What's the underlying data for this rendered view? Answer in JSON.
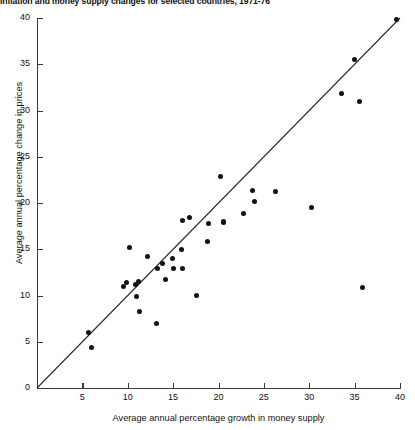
{
  "chart_data": {
    "type": "scatter",
    "title": "Inflation and money supply changes for selected countries, 1971-76",
    "xlabel": "Average annual percentage growth in money supply",
    "ylabel": "Average annual percentage change in prices",
    "xlim": [
      0,
      40
    ],
    "ylim": [
      0,
      40
    ],
    "xticks": [
      0,
      5,
      10,
      15,
      20,
      25,
      30,
      35,
      40
    ],
    "yticks": [
      0,
      5,
      10,
      15,
      20,
      25,
      30,
      35,
      40
    ],
    "xtick_labels": [
      "",
      "5",
      "10",
      "15",
      "20",
      "25",
      "30",
      "35",
      "40"
    ],
    "ytick_labels": [
      "0",
      "5",
      "10",
      "15",
      "20",
      "25",
      "30",
      "35",
      "40"
    ],
    "grid": false,
    "legend": null,
    "origin_label": "0",
    "reference_line": {
      "label": "45-degree line",
      "x": [
        0,
        40
      ],
      "y": [
        0,
        40
      ]
    },
    "marker": {
      "shape": "circle",
      "color": "#111111",
      "size": 5
    },
    "points": [
      {
        "x": 6.0,
        "y": 4.4
      },
      {
        "x": 5.7,
        "y": 6.0
      },
      {
        "x": 9.5,
        "y": 11.0
      },
      {
        "x": 9.9,
        "y": 11.4
      },
      {
        "x": 10.2,
        "y": 15.2
      },
      {
        "x": 10.8,
        "y": 11.2
      },
      {
        "x": 11.0,
        "y": 9.9
      },
      {
        "x": 11.2,
        "y": 11.5
      },
      {
        "x": 11.3,
        "y": 8.3
      },
      {
        "x": 12.2,
        "y": 14.2
      },
      {
        "x": 13.2,
        "y": 7.0
      },
      {
        "x": 13.3,
        "y": 12.9
      },
      {
        "x": 13.8,
        "y": 13.5
      },
      {
        "x": 14.2,
        "y": 11.7
      },
      {
        "x": 14.9,
        "y": 14.0
      },
      {
        "x": 15.0,
        "y": 12.9
      },
      {
        "x": 15.9,
        "y": 15.0
      },
      {
        "x": 16.0,
        "y": 12.9
      },
      {
        "x": 16.0,
        "y": 18.1
      },
      {
        "x": 16.8,
        "y": 18.4
      },
      {
        "x": 17.6,
        "y": 10.0
      },
      {
        "x": 18.8,
        "y": 15.8
      },
      {
        "x": 18.9,
        "y": 17.8
      },
      {
        "x": 20.2,
        "y": 22.9
      },
      {
        "x": 20.5,
        "y": 18.0
      },
      {
        "x": 20.6,
        "y": 17.9
      },
      {
        "x": 22.7,
        "y": 18.9
      },
      {
        "x": 23.8,
        "y": 21.4
      },
      {
        "x": 24.0,
        "y": 20.2
      },
      {
        "x": 26.3,
        "y": 21.2
      },
      {
        "x": 30.3,
        "y": 19.5
      },
      {
        "x": 33.5,
        "y": 31.8
      },
      {
        "x": 35.0,
        "y": 35.5
      },
      {
        "x": 35.5,
        "y": 31.0
      },
      {
        "x": 35.9,
        "y": 10.9
      },
      {
        "x": 39.6,
        "y": 39.8
      }
    ]
  }
}
